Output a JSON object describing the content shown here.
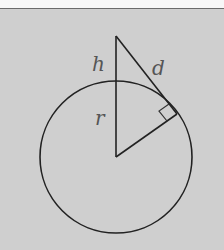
{
  "figure": {
    "labels": {
      "h": "h",
      "d": "d",
      "r": "r"
    },
    "colors": {
      "background": "#cfcfcf",
      "stroke": "#222222",
      "label": "#555555",
      "top_strip": "#f7f7f7",
      "top_rule": "#6a6a6a"
    },
    "geometry": {
      "circle_center": [
        116,
        157
      ],
      "circle_radius": 76,
      "apex": [
        116,
        36
      ],
      "tangent_point": [
        177,
        114
      ]
    }
  }
}
